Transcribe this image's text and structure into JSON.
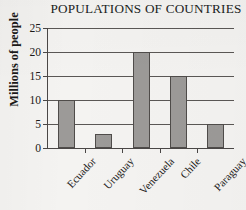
{
  "chart_data": {
    "type": "bar",
    "title": "POPULATIONS OF COUNTRIES",
    "xlabel": "",
    "ylabel": "Millions of people",
    "categories": [
      "Ecuador",
      "Uruguay",
      "Venezuela",
      "Chile",
      "Paraguay"
    ],
    "values": [
      10,
      3,
      20,
      15,
      5
    ],
    "ylim": [
      0,
      25
    ],
    "ytick_labels": [
      "0",
      "5",
      "10",
      "15",
      "20",
      "25"
    ],
    "ytick_values": [
      0,
      5,
      10,
      15,
      20,
      25
    ],
    "grid": "horizontal",
    "legend": "none",
    "bar_color": "#9c9a98",
    "bar_edge_color": "#4f4c4a",
    "axis_color": "#4a4746",
    "background_color": "#f4f3f1"
  }
}
